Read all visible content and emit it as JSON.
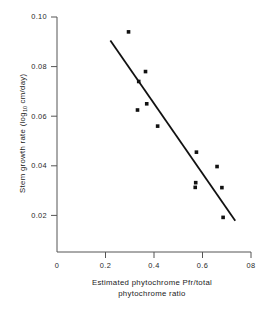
{
  "chart_data": {
    "type": "scatter",
    "title": "",
    "xlabel_line1": "Estimated phytochrome Pfr/total",
    "xlabel_line2": "phytochrome ratio",
    "ylabel_prefix": "Stem growth rate (log",
    "ylabel_sub": "10",
    "ylabel_suffix": " cm/day)",
    "xlim": [
      0,
      0.8
    ],
    "ylim": [
      0,
      0.1
    ],
    "grid": false,
    "legend": "none",
    "xticks": [
      {
        "value": 0,
        "label": "0"
      },
      {
        "value": 0.2,
        "label": "0.2"
      },
      {
        "value": 0.4,
        "label": "0.4"
      },
      {
        "value": 0.6,
        "label": "0.6"
      },
      {
        "value": 0.8,
        "label": "08"
      }
    ],
    "yticks": [
      {
        "value": 0.02,
        "label": "0.02"
      },
      {
        "value": 0.04,
        "label": "0.04"
      },
      {
        "value": 0.06,
        "label": "0.06"
      },
      {
        "value": 0.08,
        "label": "0.08"
      },
      {
        "value": 0.1,
        "label": "0.10"
      }
    ],
    "series": [
      {
        "name": "observations",
        "marker": "filled-square",
        "marker_color": "#111111",
        "x": [
          0.295,
          0.365,
          0.337,
          0.37,
          0.332,
          0.415,
          0.575,
          0.66,
          0.572,
          0.57,
          0.68,
          0.685
        ],
        "y": [
          0.094,
          0.078,
          0.074,
          0.065,
          0.0625,
          0.056,
          0.0455,
          0.0397,
          0.0332,
          0.0313,
          0.0312,
          0.0192
        ]
      },
      {
        "name": "regression-line",
        "marker": "none",
        "line_color": "#111111",
        "x": [
          0.22,
          0.735
        ],
        "y": [
          0.0905,
          0.0178
        ]
      }
    ]
  },
  "axes": {
    "x_axis_name": "x-axis",
    "y_axis_name": "y-axis"
  }
}
